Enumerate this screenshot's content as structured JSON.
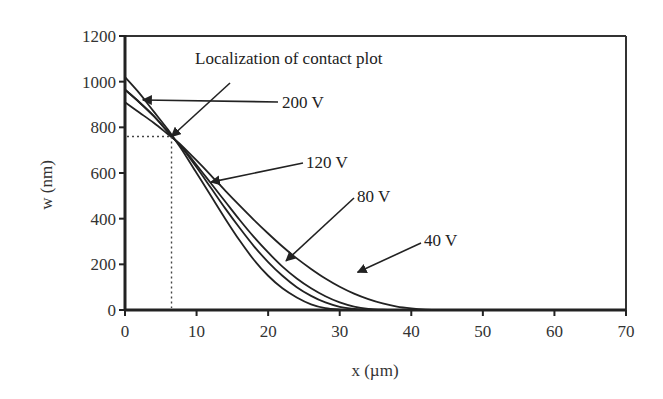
{
  "chart_data": {
    "type": "line",
    "title": "",
    "xlabel": "x (µm)",
    "ylabel": "w (nm)",
    "xlim": [
      0,
      70
    ],
    "ylim": [
      0,
      1200
    ],
    "xticks": [
      0,
      10,
      20,
      30,
      40,
      50,
      60,
      70
    ],
    "yticks": [
      0,
      200,
      400,
      600,
      800,
      1000,
      1200
    ],
    "grid": false,
    "legend": "none (inline arrow annotations)",
    "x": [
      0,
      2,
      4,
      6,
      7,
      8,
      10,
      12,
      14,
      16,
      18,
      20,
      22,
      24,
      26,
      28,
      30,
      32,
      34,
      36,
      38,
      40,
      42,
      44,
      46,
      50,
      55,
      60,
      62
    ],
    "series": [
      {
        "name": "200 V",
        "values": [
          1020,
          950,
          870,
          790,
          745,
          700,
          600,
          500,
          400,
          305,
          220,
          150,
          95,
          55,
          25,
          8,
          2,
          0,
          0,
          0,
          0,
          0,
          0,
          0,
          0,
          0,
          0,
          0,
          0
        ]
      },
      {
        "name": "120 V",
        "values": [
          965,
          910,
          850,
          780,
          745,
          710,
          625,
          535,
          445,
          360,
          280,
          210,
          150,
          100,
          62,
          33,
          14,
          5,
          1,
          0,
          0,
          0,
          0,
          0,
          0,
          0,
          0,
          0,
          0
        ]
      },
      {
        "name": "80 V",
        "values": [
          965,
          910,
          850,
          780,
          745,
          712,
          635,
          555,
          475,
          395,
          320,
          252,
          190,
          138,
          95,
          60,
          33,
          15,
          5,
          1,
          0,
          0,
          0,
          0,
          0,
          0,
          0,
          0,
          0
        ]
      },
      {
        "name": "40 V",
        "values": [
          910,
          865,
          820,
          770,
          745,
          718,
          655,
          590,
          523,
          458,
          395,
          335,
          278,
          226,
          180,
          138,
          102,
          72,
          48,
          29,
          15,
          7,
          2,
          0,
          0,
          0,
          0,
          0,
          0
        ]
      }
    ],
    "annotations": [
      {
        "text": "Localization of contact plot",
        "points_to": [
          6.5,
          760
        ]
      },
      {
        "text": "200 V",
        "points_to": [
          2.5,
          920
        ]
      },
      {
        "text": "120 V",
        "points_to": [
          12,
          560
        ]
      },
      {
        "text": "80 V",
        "points_to": [
          22.5,
          215
        ]
      },
      {
        "text": "40 V",
        "points_to": [
          32.5,
          165
        ]
      }
    ],
    "contact_point": {
      "x": 6.5,
      "w": 760
    }
  }
}
